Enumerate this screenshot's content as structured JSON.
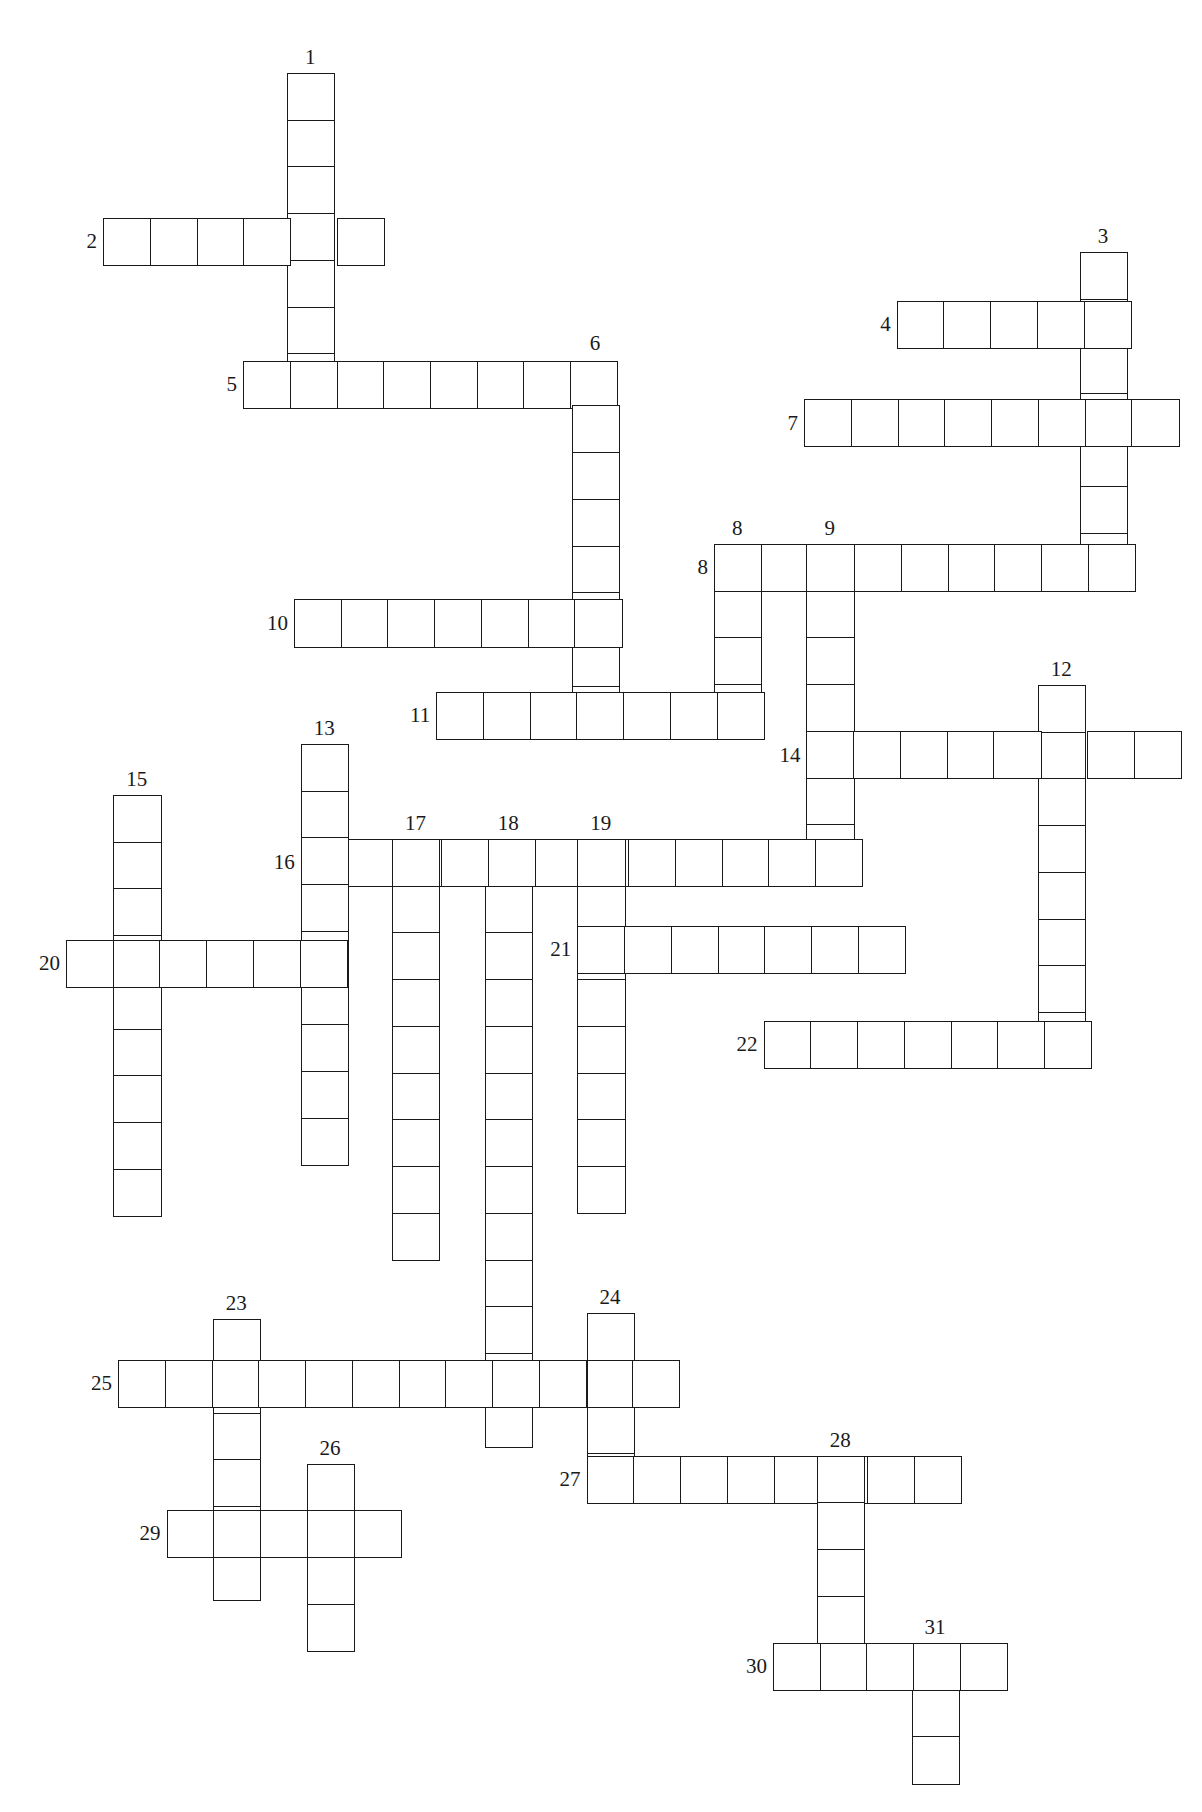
{
  "puzzle": {
    "type": "crossword",
    "scale": 1.157,
    "cell_size": 40.4,
    "words": [
      {
        "num": "1",
        "dir": "down",
        "x": 248,
        "y": 63,
        "len": 7,
        "label_pos": "top"
      },
      {
        "num": "2",
        "dir": "across",
        "x": 89,
        "y": 188,
        "len": 6,
        "label_pos": "left"
      },
      {
        "num": "3",
        "dir": "down",
        "x": 933,
        "y": 218,
        "len": 7,
        "label_pos": "top"
      },
      {
        "num": "4",
        "dir": "across",
        "x": 775,
        "y": 260,
        "len": 5,
        "label_pos": "left"
      },
      {
        "num": "5",
        "dir": "across",
        "x": 210,
        "y": 312,
        "len": 8,
        "label_pos": "left"
      },
      {
        "num": "6",
        "dir": "down",
        "x": 494,
        "y": 310,
        "len": 8,
        "label_pos": "top"
      },
      {
        "num": "7",
        "dir": "across",
        "x": 695,
        "y": 345,
        "len": 8,
        "label_pos": "left"
      },
      {
        "num": "8",
        "dir": "across",
        "x": 617,
        "y": 470,
        "len": 9,
        "label_pos": "left"
      },
      {
        "num": "8",
        "dir": "down",
        "x": 617,
        "y": 470,
        "len": 4,
        "label_pos": "top"
      },
      {
        "num": "9",
        "dir": "down",
        "x": 697,
        "y": 470,
        "len": 7,
        "label_pos": "top"
      },
      {
        "num": "10",
        "dir": "across",
        "x": 254,
        "y": 518,
        "len": 7,
        "label_pos": "left"
      },
      {
        "num": "11",
        "dir": "across",
        "x": 377,
        "y": 598,
        "len": 7,
        "label_pos": "left"
      },
      {
        "num": "12",
        "dir": "down",
        "x": 897,
        "y": 592,
        "len": 8,
        "label_pos": "top"
      },
      {
        "num": "13",
        "dir": "down",
        "x": 260,
        "y": 643,
        "len": 9,
        "label_pos": "top"
      },
      {
        "num": "14",
        "dir": "across",
        "x": 697,
        "y": 632,
        "len": 8,
        "label_pos": "left"
      },
      {
        "num": "15",
        "dir": "down",
        "x": 98,
        "y": 687,
        "len": 9,
        "label_pos": "top"
      },
      {
        "num": "16",
        "dir": "across",
        "x": 260,
        "y": 725,
        "len": 12,
        "label_pos": "left"
      },
      {
        "num": "17",
        "dir": "down",
        "x": 339,
        "y": 725,
        "len": 9,
        "label_pos": "top"
      },
      {
        "num": "18",
        "dir": "down",
        "x": 419,
        "y": 725,
        "len": 13,
        "label_pos": "top"
      },
      {
        "num": "19",
        "dir": "down",
        "x": 499,
        "y": 725,
        "len": 8,
        "label_pos": "top"
      },
      {
        "num": "20",
        "dir": "across",
        "x": 57,
        "y": 812,
        "len": 6,
        "label_pos": "left"
      },
      {
        "num": "21",
        "dir": "across",
        "x": 499,
        "y": 800,
        "len": 7,
        "label_pos": "left"
      },
      {
        "num": "22",
        "dir": "across",
        "x": 660,
        "y": 882,
        "len": 7,
        "label_pos": "left"
      },
      {
        "num": "23",
        "dir": "down",
        "x": 184,
        "y": 1140,
        "len": 6,
        "label_pos": "top"
      },
      {
        "num": "24",
        "dir": "down",
        "x": 507,
        "y": 1135,
        "len": 4,
        "label_pos": "top"
      },
      {
        "num": "25",
        "dir": "across",
        "x": 102,
        "y": 1175,
        "len": 12,
        "label_pos": "left"
      },
      {
        "num": "26",
        "dir": "down",
        "x": 265,
        "y": 1265,
        "len": 4,
        "label_pos": "top"
      },
      {
        "num": "27",
        "dir": "across",
        "x": 507,
        "y": 1258,
        "len": 8,
        "label_pos": "left"
      },
      {
        "num": "28",
        "dir": "down",
        "x": 706,
        "y": 1258,
        "len": 5,
        "label_pos": "top"
      },
      {
        "num": "29",
        "dir": "across",
        "x": 144,
        "y": 1305,
        "len": 5,
        "label_pos": "left"
      },
      {
        "num": "30",
        "dir": "across",
        "x": 668,
        "y": 1420,
        "len": 5,
        "label_pos": "left"
      },
      {
        "num": "31",
        "dir": "down",
        "x": 788,
        "y": 1420,
        "len": 3,
        "label_pos": "top"
      }
    ]
  }
}
